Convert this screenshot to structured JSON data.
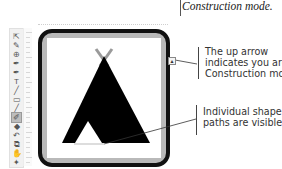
{
  "captions": {
    "top": "Construction mode.",
    "up_arrow": [
      "The up arrow",
      "indicates you are in",
      "Construction mode."
    ],
    "shape_paths": [
      "Individual shape",
      "paths are visible."
    ]
  },
  "toolbar": {
    "tools": [
      {
        "name": "selection-tool",
        "glyph": "⇱"
      },
      {
        "name": "pen-tool",
        "glyph": "✎"
      },
      {
        "name": "zoom-tool",
        "glyph": "⊕"
      },
      {
        "name": "eyedropper-tool",
        "glyph": "✒"
      },
      {
        "name": "fill-tool",
        "glyph": "✒"
      },
      {
        "name": "text-tool",
        "glyph": "T"
      },
      {
        "name": "line-tool",
        "glyph": "╱"
      },
      {
        "name": "rectangle-tool",
        "glyph": "▭"
      },
      {
        "name": "brush-tool",
        "glyph": "╱"
      },
      {
        "name": "construction-tool",
        "glyph": "✐"
      },
      {
        "name": "shape-tool",
        "glyph": "◆"
      },
      {
        "name": "rotate-tool",
        "glyph": "↶"
      },
      {
        "name": "transform-tool",
        "glyph": "⧉"
      },
      {
        "name": "hand-tool",
        "glyph": "✋"
      },
      {
        "name": "pin-tool",
        "glyph": "✦"
      }
    ],
    "selected_index": 9
  },
  "canvas": {
    "up_arrow_glyph": "▲",
    "colors": {
      "frame_border": "#111111",
      "frame_band": "#b9b9b9",
      "shape_fill": "#000000",
      "poles": "#9a9a9a"
    }
  }
}
